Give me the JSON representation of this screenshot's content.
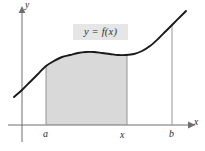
{
  "figure": {
    "background_color": "#ffffff",
    "curve_color": "#1a1a1a",
    "axis_color": "#6e6e6e",
    "shade_color": "#d9d9d9",
    "label_box_color": "#e6e6e6",
    "text_color": "#2b2b2b"
  },
  "axes": {
    "y_label": "y",
    "x_label": "x",
    "origin_px": {
      "x": 22,
      "y": 125
    }
  },
  "curve": {
    "label": "y = f(x)",
    "label_box": {
      "x": 73,
      "y": 24,
      "width": 55,
      "height": 16
    }
  },
  "ticks": [
    {
      "name": "a",
      "label": "a",
      "x_px": 46
    },
    {
      "name": "x",
      "label": "x",
      "x_px": 124
    },
    {
      "name": "b",
      "label": "b",
      "x_px": 172
    }
  ],
  "shaded_region": {
    "from_tick": "a",
    "to_tick": "x",
    "left_px": 46,
    "right_px": 127,
    "bottom_px": 125
  },
  "chart_data": {
    "type": "line",
    "title": "",
    "xlabel": "x",
    "ylabel": "y",
    "grid": false,
    "legend": null,
    "annotations": [
      {
        "text": "y = f(x)",
        "kind": "curve-label",
        "x_px": 100,
        "y_px": 32
      },
      {
        "text": "a",
        "kind": "x-tick",
        "x_px": 46
      },
      {
        "text": "x",
        "kind": "x-tick",
        "x_px": 124
      },
      {
        "text": "b",
        "kind": "x-tick",
        "x_px": 172
      }
    ],
    "series": [
      {
        "name": "f(x)",
        "points_px": [
          [
            14,
            97
          ],
          [
            22,
            90
          ],
          [
            30,
            82
          ],
          [
            38,
            74
          ],
          [
            46,
            66
          ],
          [
            54,
            61
          ],
          [
            62,
            57
          ],
          [
            70,
            55
          ],
          [
            78,
            53
          ],
          [
            86,
            52
          ],
          [
            94,
            52
          ],
          [
            102,
            53
          ],
          [
            110,
            54
          ],
          [
            118,
            55
          ],
          [
            126,
            55
          ],
          [
            134,
            54
          ],
          [
            142,
            51
          ],
          [
            150,
            46
          ],
          [
            158,
            39
          ],
          [
            166,
            31
          ],
          [
            174,
            23
          ],
          [
            182,
            15
          ],
          [
            186,
            11
          ]
        ]
      }
    ],
    "vertical_lines_px": [
      {
        "name": "line-at-a",
        "x": 46,
        "y_top": 66,
        "y_bottom": 125
      },
      {
        "name": "line-at-x",
        "x": 127,
        "y_top": 55,
        "y_bottom": 125
      },
      {
        "name": "line-at-b",
        "x": 172,
        "y_top": 25,
        "y_bottom": 125
      }
    ],
    "shaded_area": {
      "name": "area-under-curve-a-to-x",
      "x_from_px": 46,
      "x_to_px": 127,
      "baseline_y_px": 125
    }
  }
}
